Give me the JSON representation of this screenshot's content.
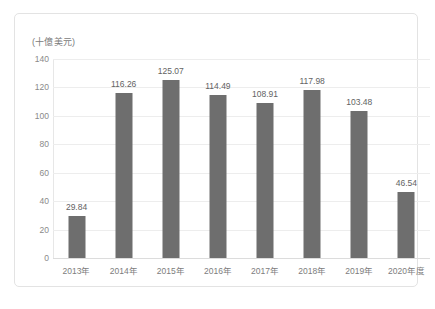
{
  "chart_data": {
    "type": "bar",
    "title": "",
    "subtitle": "",
    "unit_caption": "(十億美元)",
    "xlabel": "",
    "ylabel": "",
    "categories": [
      "2013年",
      "2014年",
      "2015年",
      "2016年",
      "2017年",
      "2018年",
      "2019年",
      "2020年度"
    ],
    "values": [
      29.84,
      116.26,
      125.07,
      114.49,
      108.91,
      117.98,
      103.48,
      46.54
    ],
    "data_labels": [
      "29.84",
      "116.26",
      "125.07",
      "114.49",
      "108.91",
      "117.98",
      "103.48",
      "46.54"
    ],
    "ylim": [
      0,
      140
    ],
    "yticks": [
      0,
      20,
      40,
      60,
      80,
      100,
      120,
      140
    ],
    "ytick_labels": [
      "0",
      "20",
      "40",
      "60",
      "80",
      "100",
      "120",
      "140"
    ],
    "grid": true,
    "legend": false,
    "series": [
      {
        "name": "",
        "values": [
          29.84,
          116.26,
          125.07,
          114.49,
          108.91,
          117.98,
          103.48,
          46.54
        ]
      }
    ],
    "colors": {
      "bar": "#6e6e6e",
      "gridline": "#ededed",
      "axis_text": "#7d7d7d",
      "label_text": "#636363",
      "border": "#e3e3e3",
      "background": "#ffffff"
    }
  }
}
